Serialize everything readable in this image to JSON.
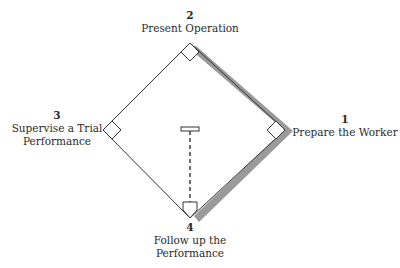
{
  "diagram": {
    "title": "",
    "colors": {
      "line": "#333333",
      "shade": "#9a9a9a",
      "background": "#ffffff"
    },
    "steps": [
      {
        "number": "1",
        "label": "Prepare the Worker"
      },
      {
        "number": "2",
        "label": "Present Operation"
      },
      {
        "number": "3",
        "label": "Supervise a Trial Performance"
      },
      {
        "number": "4",
        "label": "Follow up the Performance"
      }
    ],
    "step3_lines": [
      "Supervise a Trial",
      "Performance"
    ],
    "step4_lines": [
      "Follow up the",
      "Performance"
    ]
  }
}
